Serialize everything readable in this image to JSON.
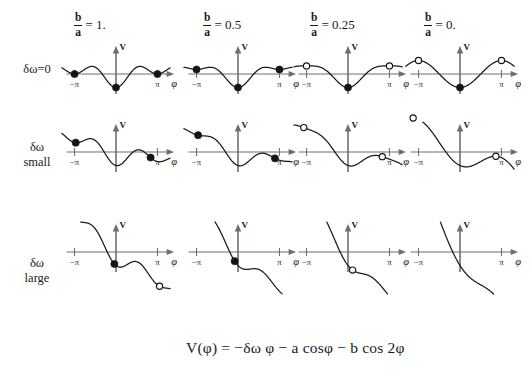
{
  "figure": {
    "equation": "V(φ) = −δω φ − a cosφ − b cos 2φ",
    "axis_label_x": "φ",
    "axis_label_y": "V",
    "tick_left": "−π",
    "tick_right": "π"
  },
  "columns": [
    {
      "label": "α ratio 1",
      "numerator": "b",
      "denominator": "a",
      "equals": "= 1."
    },
    {
      "label": "α ratio 0.5",
      "numerator": "b",
      "denominator": "a",
      "equals": "= 0.5"
    },
    {
      "label": "α ratio 0.25",
      "numerator": "b",
      "denominator": "a",
      "equals": "= 0.25"
    },
    {
      "label": "α ratio 0",
      "numerator": "b",
      "denominator": "a",
      "equals": "= 0."
    }
  ],
  "rows": [
    {
      "line1": "δω=0",
      "line2": ""
    },
    {
      "line1": "δω",
      "line2": "small"
    },
    {
      "line1": "δω",
      "line2": "large"
    }
  ],
  "chart_data": {
    "type": "line",
    "title": "",
    "xlabel": "φ",
    "ylabel": "V",
    "formula": "V(phi) = -dw*phi - a*cos(phi) - b*cos(2*phi)",
    "a": 1.0,
    "xlim": [
      -4.9,
      4.9
    ],
    "xticks": [
      -3.14159,
      3.14159
    ],
    "xticklabels": [
      "−π",
      "π"
    ],
    "grid": false,
    "legend": "none",
    "panels": [
      {
        "row": 0,
        "col": 0,
        "b_over_a": 1.0,
        "domega": 0.0,
        "markers": [
          {
            "phi": -3.14159,
            "type": "filled"
          },
          {
            "phi": 0.0,
            "type": "filled"
          },
          {
            "phi": 3.14159,
            "type": "filled"
          }
        ]
      },
      {
        "row": 0,
        "col": 1,
        "b_over_a": 0.5,
        "domega": 0.0,
        "markers": [
          {
            "phi": -3.14159,
            "type": "filled"
          },
          {
            "phi": 0.0,
            "type": "filled"
          },
          {
            "phi": 3.14159,
            "type": "filled"
          }
        ]
      },
      {
        "row": 0,
        "col": 2,
        "b_over_a": 0.25,
        "domega": 0.0,
        "markers": [
          {
            "phi": -3.14159,
            "type": "open"
          },
          {
            "phi": 0.0,
            "type": "filled"
          },
          {
            "phi": 3.14159,
            "type": "open"
          }
        ]
      },
      {
        "row": 0,
        "col": 3,
        "b_over_a": 0.0,
        "domega": 0.0,
        "markers": [
          {
            "phi": -3.14159,
            "type": "open"
          },
          {
            "phi": 0.0,
            "type": "filled"
          },
          {
            "phi": 3.14159,
            "type": "open"
          }
        ]
      },
      {
        "row": 1,
        "col": 0,
        "b_over_a": 1.0,
        "domega": 0.45,
        "markers": [
          {
            "phi": -3.05,
            "type": "filled"
          },
          {
            "phi": 2.62,
            "type": "filled"
          }
        ]
      },
      {
        "row": 1,
        "col": 1,
        "b_over_a": 0.5,
        "domega": 0.45,
        "markers": [
          {
            "phi": -3.02,
            "type": "filled"
          },
          {
            "phi": 2.8,
            "type": "filled"
          }
        ]
      },
      {
        "row": 1,
        "col": 2,
        "b_over_a": 0.25,
        "domega": 0.45,
        "markers": [
          {
            "phi": -3.35,
            "type": "open"
          },
          {
            "phi": 2.6,
            "type": "open"
          }
        ]
      },
      {
        "row": 1,
        "col": 3,
        "b_over_a": 0.0,
        "domega": 0.45,
        "markers": [
          {
            "phi": -3.55,
            "type": "open"
          },
          {
            "phi": 2.72,
            "type": "open"
          }
        ]
      },
      {
        "row": 2,
        "col": 0,
        "b_over_a": 1.0,
        "domega": 1.55,
        "markers": [
          {
            "phi": -3.5,
            "type": "open"
          },
          {
            "phi": -0.12,
            "type": "filled"
          },
          {
            "phi": 3.3,
            "type": "open"
          }
        ]
      },
      {
        "row": 2,
        "col": 1,
        "b_over_a": 0.5,
        "domega": 1.55,
        "markers": [
          {
            "phi": -0.25,
            "type": "filled"
          }
        ]
      },
      {
        "row": 2,
        "col": 2,
        "b_over_a": 0.25,
        "domega": 1.55,
        "markers": [
          {
            "phi": 0.35,
            "type": "open"
          }
        ]
      },
      {
        "row": 2,
        "col": 3,
        "b_over_a": 0.0,
        "domega": 1.55,
        "markers": []
      }
    ]
  }
}
